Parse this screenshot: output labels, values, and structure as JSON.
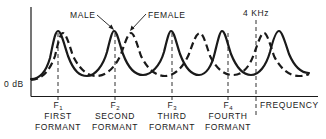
{
  "diagram": {
    "y_axis_label": "0 dB",
    "x_axis_label": "FREQUENCY",
    "marker_4khz": "4 KHz",
    "legend": {
      "male": "MALE",
      "female": "FEMALE"
    },
    "formants": [
      {
        "symbol": "F",
        "index": "1",
        "line1": "FIRST",
        "line2": "FORMANT"
      },
      {
        "symbol": "F",
        "index": "2",
        "line1": "SECOND",
        "line2": "FORMANT"
      },
      {
        "symbol": "F",
        "index": "3",
        "line1": "THIRD",
        "line2": "FORMANT"
      },
      {
        "symbol": "F",
        "index": "4",
        "line1": "FOURTH",
        "line2": "FORMANT"
      }
    ],
    "series": [
      {
        "name": "MALE",
        "style": "solid",
        "peak_x": [
          58,
          114,
          171,
          222,
          279
        ]
      },
      {
        "name": "FEMALE",
        "style": "dashed",
        "peak_x": [
          63,
          131,
          200,
          264
        ]
      }
    ],
    "colors": {
      "ink": "#1a1a1a",
      "background": "#ffffff"
    }
  }
}
